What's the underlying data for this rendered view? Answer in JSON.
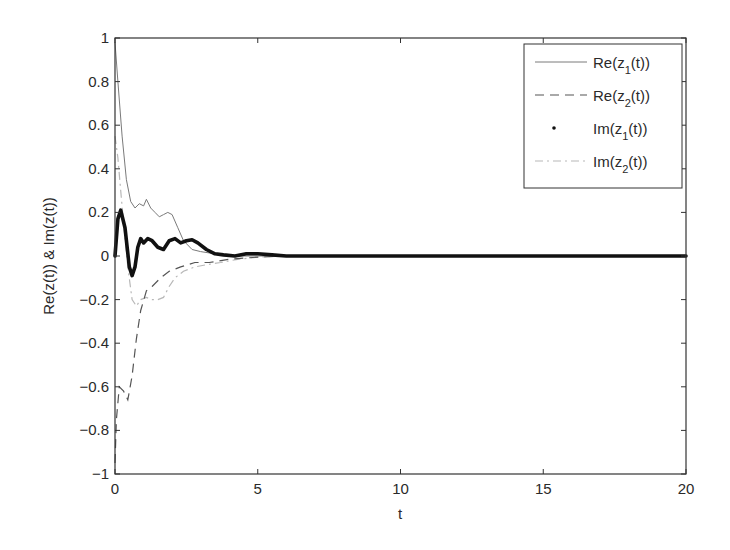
{
  "chart_data": {
    "type": "line",
    "title": "",
    "xlabel": "t",
    "ylabel": "Re(z(t)) & Im(z(t))",
    "xlim": [
      0,
      20
    ],
    "ylim": [
      -1,
      1
    ],
    "xticks": [
      0,
      5,
      10,
      15,
      20
    ],
    "xtick_labels": [
      "0",
      "5",
      "10",
      "15",
      "20"
    ],
    "yticks": [
      1,
      0.8,
      0.6,
      0.4,
      0.2,
      0,
      -0.2,
      -0.4,
      -0.6,
      -0.8,
      -1
    ],
    "ytick_labels": [
      "1",
      "0.8",
      "0.6",
      "0.4",
      "0.2",
      "0",
      "-0.2",
      "-0.4",
      "-0.6",
      "-0.8",
      "-1"
    ],
    "grid": false,
    "legend_position": "upper right",
    "series": [
      {
        "name": "Re(z1(t))",
        "legend_main": "Re(z",
        "legend_sub": "1",
        "legend_tail": "(t))",
        "style": "solid-thin",
        "color": "#7a7a7a",
        "x": [
          0,
          0.1,
          0.25,
          0.4,
          0.55,
          0.7,
          0.85,
          1.0,
          1.1,
          1.25,
          1.4,
          1.55,
          1.7,
          1.85,
          2.0,
          2.2,
          2.4,
          2.7,
          3.0,
          3.5,
          4.0,
          5.0,
          6.0,
          8.0,
          20.0
        ],
        "y": [
          0.98,
          0.8,
          0.55,
          0.35,
          0.25,
          0.22,
          0.24,
          0.23,
          0.26,
          0.22,
          0.2,
          0.18,
          0.19,
          0.2,
          0.19,
          0.13,
          0.07,
          0.03,
          0.02,
          0.01,
          0.0,
          0.0,
          0.0,
          0.0,
          0.0
        ]
      },
      {
        "name": "Re(z2(t))",
        "legend_main": "Re(z",
        "legend_sub": "2",
        "legend_tail": "(t))",
        "style": "dashed",
        "color": "#555555",
        "x": [
          0,
          0.05,
          0.15,
          0.3,
          0.45,
          0.6,
          0.75,
          0.9,
          1.1,
          1.3,
          1.6,
          1.9,
          2.3,
          2.8,
          3.3,
          4.0,
          5.0,
          6.0,
          20.0
        ],
        "y": [
          -0.95,
          -0.75,
          -0.6,
          -0.62,
          -0.66,
          -0.55,
          -0.38,
          -0.25,
          -0.16,
          -0.14,
          -0.1,
          -0.07,
          -0.05,
          -0.03,
          -0.03,
          -0.015,
          -0.005,
          0.0,
          0.0
        ]
      },
      {
        "name": "Im(z1(t))",
        "legend_main": "Im(z",
        "legend_sub": "1",
        "legend_tail": "(t))",
        "style": "dotted-thick",
        "color": "#111111",
        "x": [
          0,
          0.1,
          0.2,
          0.35,
          0.5,
          0.6,
          0.7,
          0.8,
          0.9,
          1.0,
          1.15,
          1.3,
          1.5,
          1.7,
          1.9,
          2.1,
          2.3,
          2.5,
          2.7,
          2.9,
          3.2,
          3.5,
          3.8,
          4.2,
          4.6,
          5.0,
          5.5,
          6.0,
          7.0,
          20.0
        ],
        "y": [
          0.0,
          0.17,
          0.21,
          0.13,
          -0.05,
          -0.09,
          -0.05,
          0.04,
          0.08,
          0.06,
          0.08,
          0.07,
          0.04,
          0.03,
          0.07,
          0.08,
          0.06,
          0.07,
          0.075,
          0.06,
          0.03,
          0.01,
          0.005,
          0.0,
          0.01,
          0.01,
          0.005,
          0.0,
          0.0,
          0.0
        ]
      },
      {
        "name": "Im(z2(t))",
        "legend_main": "Im(z",
        "legend_sub": "2",
        "legend_tail": "(t))",
        "style": "dashdot-light",
        "color": "#b8b8b8",
        "x": [
          0,
          0.1,
          0.2,
          0.3,
          0.45,
          0.6,
          0.75,
          0.9,
          1.1,
          1.3,
          1.5,
          1.7,
          1.9,
          2.1,
          2.4,
          2.8,
          3.2,
          3.7,
          4.3,
          5.0,
          6.0,
          20.0
        ],
        "y": [
          0.55,
          0.45,
          0.3,
          0.15,
          -0.05,
          -0.2,
          -0.23,
          -0.2,
          -0.19,
          -0.2,
          -0.2,
          -0.19,
          -0.14,
          -0.1,
          -0.07,
          -0.05,
          -0.04,
          -0.03,
          -0.015,
          -0.005,
          0.0,
          0.0
        ]
      }
    ]
  }
}
